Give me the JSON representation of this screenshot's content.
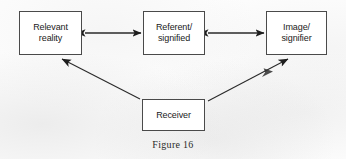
{
  "figure": {
    "caption": "Figure 16",
    "background_color": "#fdfdfd",
    "line_color": "#2a2a2a",
    "box_border_color": "#4a4a4a",
    "box_fill_color": "#ffffff",
    "text_color": "#1a1a1a"
  },
  "nodes": [
    {
      "id": "relevant-reality",
      "label": "Relevant\nreality"
    },
    {
      "id": "referent-signified",
      "label": "Referent/\nsignified"
    },
    {
      "id": "image-signifier",
      "label": "Image/\nsignifier"
    },
    {
      "id": "receiver",
      "label": "Receiver"
    }
  ],
  "connectors": [
    {
      "id": "relevant-reality-to-referent",
      "from": "relevant-reality",
      "to": "referent-signified",
      "style": "double-headed",
      "orientation": "horizontal"
    },
    {
      "id": "referent-to-image",
      "from": "referent-signified",
      "to": "image-signifier",
      "style": "double-headed",
      "orientation": "horizontal"
    },
    {
      "id": "receiver-to-relevant-reality",
      "from": "receiver",
      "to": "relevant-reality",
      "style": "single-headed",
      "orientation": "diagonal-up-left"
    },
    {
      "id": "receiver-to-image",
      "from": "receiver",
      "to": "image-signifier",
      "style": "single-headed",
      "orientation": "diagonal-up-right"
    }
  ]
}
